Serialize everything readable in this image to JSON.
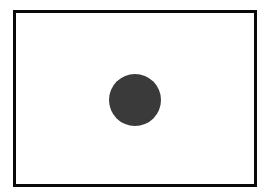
{
  "diagram": {
    "background_color": "#ffffff",
    "frame": {
      "x": 13,
      "y": 10,
      "width": 244,
      "height": 177,
      "border_width": 3,
      "border_color": "#0a0a0a",
      "fill_color": "#ffffff"
    },
    "circle": {
      "cx": 135,
      "cy": 100,
      "diameter": 52,
      "fill_color": "#3a3a3a"
    }
  }
}
